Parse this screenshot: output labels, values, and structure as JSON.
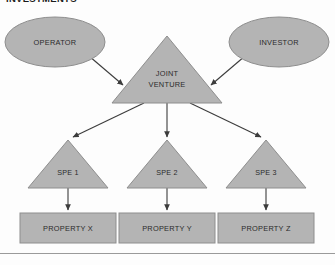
{
  "page": {
    "title": "INVESTMENTS",
    "width": 335,
    "height": 265
  },
  "colors": {
    "shape_fill": "#b4b4b4",
    "shape_stroke": "#8e8e8e",
    "arrow": "#3c3c3c",
    "text": "#2b2b2b",
    "background": "#fdfdfd",
    "rule": "#9a9a9a"
  },
  "diagram": {
    "type": "flow-hierarchy",
    "nodes": [
      {
        "id": "operator",
        "label": "OPERATOR",
        "shape": "ellipse",
        "level": 1
      },
      {
        "id": "investor",
        "label": "INVESTOR",
        "shape": "ellipse",
        "level": 1
      },
      {
        "id": "jv",
        "label_line1": "JOINT",
        "label_line2": "VENTURE",
        "label": "JOINT VENTURE",
        "shape": "triangle",
        "level": 2
      },
      {
        "id": "spe1",
        "label": "SPE 1",
        "shape": "triangle",
        "level": 3
      },
      {
        "id": "spe2",
        "label": "SPE 2",
        "shape": "triangle",
        "level": 3
      },
      {
        "id": "spe3",
        "label": "SPE 3",
        "shape": "triangle",
        "level": 3
      },
      {
        "id": "propertyx",
        "label": "PROPERTY X",
        "shape": "rectangle",
        "level": 4
      },
      {
        "id": "propertyy",
        "label": "PROPERTY Y",
        "shape": "rectangle",
        "level": 4
      },
      {
        "id": "propertyz",
        "label": "PROPERTY Z",
        "shape": "rectangle",
        "level": 4
      }
    ],
    "edges": [
      {
        "from": "operator",
        "to": "jv",
        "style": "arrow"
      },
      {
        "from": "investor",
        "to": "jv",
        "style": "arrow"
      },
      {
        "from": "jv",
        "to": "spe1",
        "style": "arrow"
      },
      {
        "from": "jv",
        "to": "spe2",
        "style": "arrow"
      },
      {
        "from": "jv",
        "to": "spe3",
        "style": "arrow"
      },
      {
        "from": "spe1",
        "to": "propertyx",
        "style": "arrow"
      },
      {
        "from": "spe2",
        "to": "propertyy",
        "style": "arrow"
      },
      {
        "from": "spe3",
        "to": "propertyz",
        "style": "arrow"
      }
    ]
  }
}
